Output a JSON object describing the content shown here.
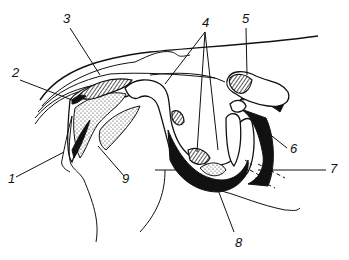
{
  "figure": {
    "type": "anatomical line drawing",
    "background": "#ffffff",
    "ink": "#111111"
  },
  "labels": [
    {
      "id": "1",
      "text": "1",
      "x": 8,
      "y": 183
    },
    {
      "id": "2",
      "text": "2",
      "x": 12,
      "y": 77
    },
    {
      "id": "3",
      "text": "3",
      "x": 63,
      "y": 23
    },
    {
      "id": "4",
      "text": "4",
      "x": 202,
      "y": 27
    },
    {
      "id": "5",
      "text": "5",
      "x": 242,
      "y": 23
    },
    {
      "id": "6",
      "text": "6",
      "x": 290,
      "y": 153
    },
    {
      "id": "7",
      "text": "7",
      "x": 330,
      "y": 173
    },
    {
      "id": "8",
      "text": "8",
      "x": 235,
      "y": 247
    },
    {
      "id": "9",
      "text": "9",
      "x": 122,
      "y": 183
    }
  ]
}
